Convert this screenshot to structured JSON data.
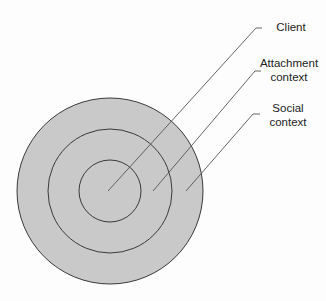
{
  "diagram": {
    "type": "concentric-circles",
    "colors": {
      "fill": "#c9c9c9",
      "stroke": "#3a3a3a",
      "leader": "#555555"
    },
    "circles": [
      {
        "name": "social-context",
        "cx": 110,
        "cy": 191,
        "r": 93
      },
      {
        "name": "attachment-context",
        "cx": 110,
        "cy": 191,
        "r": 62
      },
      {
        "name": "client",
        "cx": 110,
        "cy": 191,
        "r": 31
      }
    ],
    "labels": [
      {
        "line1": "Client",
        "line2": ""
      },
      {
        "line1": "Attachment",
        "line2": "context"
      },
      {
        "line1": "Social",
        "line2": "context"
      }
    ]
  }
}
